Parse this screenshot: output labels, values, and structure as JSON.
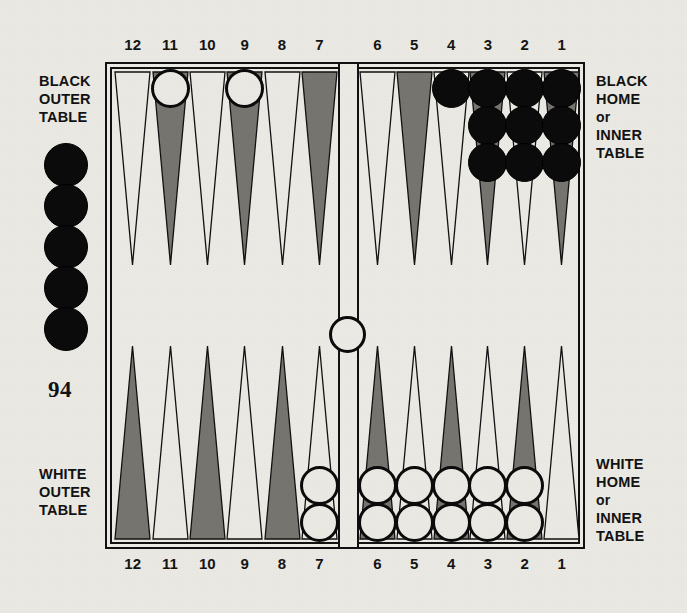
{
  "page": {
    "page_number": "94"
  },
  "labels": {
    "black_outer": {
      "line1": "BLACK",
      "line2": "OUTER",
      "line3": "TABLE"
    },
    "white_outer": {
      "line1": "WHITE",
      "line2": "OUTER",
      "line3": "TABLE"
    },
    "black_home": {
      "line1": "BLACK",
      "line2": "HOME",
      "line3": "or",
      "line4": "INNER",
      "line5": "TABLE"
    },
    "white_home": {
      "line1": "WHITE",
      "line2": "HOME",
      "line3": "or",
      "line4": "INNER",
      "line5": "TABLE"
    }
  },
  "top_numbers": [
    "12",
    "11",
    "10",
    "9",
    "8",
    "7",
    "6",
    "5",
    "4",
    "3",
    "2",
    "1"
  ],
  "bottom_numbers": [
    "12",
    "11",
    "10",
    "9",
    "8",
    "7",
    "6",
    "5",
    "4",
    "3",
    "2",
    "1"
  ],
  "colors": {
    "paper": "#eceae4",
    "ink": "#111111",
    "point_shaded": "#77756f",
    "point_light": "#eceae4",
    "checker_black": "#0b0b0b",
    "checker_white": "#eceae4"
  },
  "chart_data": {
    "type": "table",
    "board": {
      "bar_checkers": [
        {
          "color": "white",
          "count": 1
        }
      ],
      "borne_off_black": 5,
      "quadrants": [
        {
          "name": "black-outer-table",
          "position": "top-left",
          "points": [
            {
              "number": "12",
              "shade": "light",
              "checkers": 0,
              "checker_color": null
            },
            {
              "number": "11",
              "shade": "shaded",
              "checkers": 1,
              "checker_color": "white"
            },
            {
              "number": "10",
              "shade": "light",
              "checkers": 0,
              "checker_color": null
            },
            {
              "number": "9",
              "shade": "shaded",
              "checkers": 1,
              "checker_color": "white"
            },
            {
              "number": "8",
              "shade": "light",
              "checkers": 0,
              "checker_color": null
            },
            {
              "number": "7",
              "shade": "shaded",
              "checkers": 0,
              "checker_color": null
            }
          ]
        },
        {
          "name": "black-home-inner-table",
          "position": "top-right",
          "points": [
            {
              "number": "6",
              "shade": "light",
              "checkers": 0,
              "checker_color": null
            },
            {
              "number": "5",
              "shade": "shaded",
              "checkers": 0,
              "checker_color": null
            },
            {
              "number": "4",
              "shade": "light",
              "checkers": 1,
              "checker_color": "black"
            },
            {
              "number": "3",
              "shade": "shaded",
              "checkers": 3,
              "checker_color": "black"
            },
            {
              "number": "2",
              "shade": "light",
              "checkers": 3,
              "checker_color": "black"
            },
            {
              "number": "1",
              "shade": "shaded",
              "checkers": 3,
              "checker_color": "black"
            }
          ]
        },
        {
          "name": "white-outer-table",
          "position": "bottom-left",
          "points": [
            {
              "number": "12",
              "shade": "shaded",
              "checkers": 0,
              "checker_color": null
            },
            {
              "number": "11",
              "shade": "light",
              "checkers": 0,
              "checker_color": null
            },
            {
              "number": "10",
              "shade": "shaded",
              "checkers": 0,
              "checker_color": null
            },
            {
              "number": "9",
              "shade": "light",
              "checkers": 0,
              "checker_color": null
            },
            {
              "number": "8",
              "shade": "shaded",
              "checkers": 0,
              "checker_color": null
            },
            {
              "number": "7",
              "shade": "light",
              "checkers": 2,
              "checker_color": "white"
            }
          ]
        },
        {
          "name": "white-home-inner-table",
          "position": "bottom-right",
          "points": [
            {
              "number": "6",
              "shade": "shaded",
              "checkers": 2,
              "checker_color": "white"
            },
            {
              "number": "5",
              "shade": "light",
              "checkers": 2,
              "checker_color": "white"
            },
            {
              "number": "4",
              "shade": "shaded",
              "checkers": 2,
              "checker_color": "white"
            },
            {
              "number": "3",
              "shade": "light",
              "checkers": 2,
              "checker_color": "white"
            },
            {
              "number": "2",
              "shade": "shaded",
              "checkers": 2,
              "checker_color": "white"
            },
            {
              "number": "1",
              "shade": "light",
              "checkers": 0,
              "checker_color": null
            }
          ]
        }
      ]
    }
  }
}
